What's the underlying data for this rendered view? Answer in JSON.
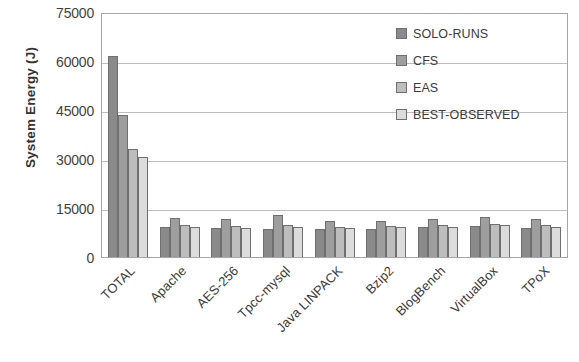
{
  "chart_data": {
    "type": "bar",
    "title": "",
    "xlabel": "",
    "ylabel": "System Energy (J)",
    "ylim": [
      0,
      75000
    ],
    "yticks": [
      0,
      15000,
      30000,
      45000,
      60000,
      75000
    ],
    "ytick_labels": [
      "0",
      "15000",
      "30000",
      "45000",
      "60000",
      "75000"
    ],
    "grid": true,
    "legend_position": "top-right",
    "categories": [
      "TOTAL",
      "Apache",
      "AES-256",
      "Tpcc-mysql",
      "Java LINPACK",
      "Bzip2",
      "BlogBench",
      "VirtualBox",
      "TPoX"
    ],
    "series": [
      {
        "name": "SOLO-RUNS",
        "color": "#8a8a8a",
        "values": [
          61500,
          9200,
          8800,
          8700,
          8600,
          8700,
          9300,
          9500,
          8900
        ]
      },
      {
        "name": "CFS",
        "color": "#9e9e9e",
        "values": [
          43500,
          12000,
          11500,
          13000,
          10900,
          11000,
          11500,
          12400,
          11600
        ]
      },
      {
        "name": "EAS",
        "color": "#bdbdbd",
        "values": [
          33000,
          9800,
          9400,
          9700,
          9300,
          9500,
          9800,
          10200,
          9700
        ]
      },
      {
        "name": "BEST-OBSERVED",
        "color": "#dcdcdc",
        "values": [
          30500,
          9300,
          9000,
          9200,
          8900,
          9100,
          9300,
          9700,
          9200
        ]
      }
    ]
  },
  "axis": {
    "y_title": "System Energy (J)"
  }
}
